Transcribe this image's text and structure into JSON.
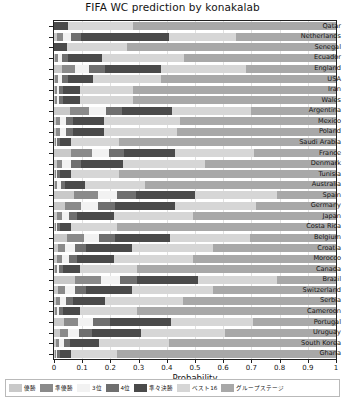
{
  "chart_data": {
    "type": "bar",
    "orientation": "horizontal",
    "stacked": true,
    "title": "FIFA WC prediction by konakalab",
    "xlabel": "Probability",
    "ylabel": "",
    "xlim": [
      0,
      1
    ],
    "xticks": [
      "0",
      "0.1",
      "0.2",
      "0.3",
      "0.4",
      "0.5",
      "0.6",
      "0.7",
      "0.8",
      "0.9",
      "1"
    ],
    "grid": true,
    "legend_position": "bottom",
    "legend": [
      "優勝",
      "準優勝",
      "3位",
      "4位",
      "準々決勝",
      "ベスト16",
      "グループステージ"
    ],
    "colors": [
      "#c9c9c9",
      "#8a8a8a",
      "#f2f2f2",
      "#6f6f6f",
      "#4a4a4a",
      "#d6d6d6",
      "#a8a8a8"
    ],
    "categories": [
      "Qatar",
      "Netherlands",
      "Senegal",
      "Ecuador",
      "England",
      "USA",
      "Iran",
      "Wales",
      "Argentina",
      "Mexico",
      "Poland",
      "Saudi Arabia",
      "France",
      "Denmark",
      "Tunisia",
      "Australia",
      "Spain",
      "Germany",
      "Japan",
      "Costa Rica",
      "Belgium",
      "Croatia",
      "Morocco",
      "Canada",
      "Brazil",
      "Switzerland",
      "Serbia",
      "Cameroon",
      "Portugal",
      "Uruguay",
      "South Korea",
      "Ghana"
    ],
    "series": [
      {
        "name": "優勝",
        "values": [
          0.0,
          0.012,
          0.0,
          0.005,
          0.03,
          0.005,
          0.003,
          0.003,
          0.055,
          0.008,
          0.008,
          0.002,
          0.06,
          0.01,
          0.002,
          0.004,
          0.07,
          0.04,
          0.01,
          0.002,
          0.045,
          0.015,
          0.01,
          0.003,
          0.075,
          0.015,
          0.008,
          0.003,
          0.035,
          0.02,
          0.006,
          0.002
        ]
      },
      {
        "name": "準優勝",
        "values": [
          0.0,
          0.02,
          0.0,
          0.01,
          0.045,
          0.01,
          0.006,
          0.006,
          0.07,
          0.015,
          0.015,
          0.004,
          0.075,
          0.02,
          0.004,
          0.008,
          0.085,
          0.055,
          0.018,
          0.004,
          0.06,
          0.025,
          0.018,
          0.006,
          0.09,
          0.025,
          0.014,
          0.006,
          0.05,
          0.03,
          0.012,
          0.004
        ]
      },
      {
        "name": "3位",
        "values": [
          0.0,
          0.03,
          0.0,
          0.015,
          0.05,
          0.015,
          0.01,
          0.01,
          0.06,
          0.02,
          0.02,
          0.006,
          0.06,
          0.03,
          0.006,
          0.012,
          0.07,
          0.06,
          0.025,
          0.006,
          0.055,
          0.035,
          0.025,
          0.01,
          0.07,
          0.035,
          0.02,
          0.01,
          0.055,
          0.04,
          0.018,
          0.006
        ]
      },
      {
        "name": "4位",
        "values": [
          0.0,
          0.035,
          0.0,
          0.02,
          0.055,
          0.02,
          0.012,
          0.012,
          0.055,
          0.025,
          0.025,
          0.008,
          0.055,
          0.035,
          0.008,
          0.015,
          0.065,
          0.06,
          0.03,
          0.008,
          0.055,
          0.04,
          0.03,
          0.012,
          0.06,
          0.04,
          0.025,
          0.012,
          0.06,
          0.045,
          0.022,
          0.008
        ]
      },
      {
        "name": "準々決勝",
        "values": [
          0.05,
          0.31,
          0.045,
          0.12,
          0.2,
          0.09,
          0.06,
          0.06,
          0.18,
          0.11,
          0.11,
          0.04,
          0.18,
          0.15,
          0.04,
          0.07,
          0.21,
          0.215,
          0.13,
          0.04,
          0.195,
          0.16,
          0.13,
          0.06,
          0.215,
          0.16,
          0.115,
          0.06,
          0.215,
          0.175,
          0.1,
          0.04
        ]
      },
      {
        "name": "ベスト16",
        "values": [
          0.23,
          0.24,
          0.215,
          0.29,
          0.3,
          0.24,
          0.19,
          0.19,
          0.28,
          0.27,
          0.26,
          0.17,
          0.28,
          0.29,
          0.17,
          0.215,
          0.29,
          0.285,
          0.28,
          0.165,
          0.285,
          0.29,
          0.28,
          0.205,
          0.28,
          0.29,
          0.275,
          0.205,
          0.29,
          0.295,
          0.25,
          0.165
        ]
      },
      {
        "name": "グループステージ",
        "values": [
          0.72,
          0.353,
          0.74,
          0.54,
          0.32,
          0.62,
          0.719,
          0.719,
          0.3,
          0.552,
          0.562,
          0.77,
          0.29,
          0.465,
          0.77,
          0.676,
          0.21,
          0.285,
          0.507,
          0.775,
          0.305,
          0.435,
          0.507,
          0.704,
          0.21,
          0.435,
          0.543,
          0.704,
          0.295,
          0.395,
          0.592,
          0.775
        ]
      }
    ]
  }
}
